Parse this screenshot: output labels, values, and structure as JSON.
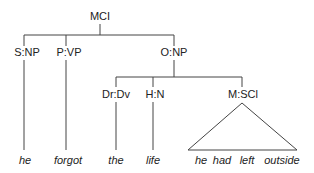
{
  "tree": {
    "root": "MCI",
    "children": [
      {
        "label": "S:NP",
        "leaf": "he"
      },
      {
        "label": "P:VP",
        "leaf": "forgot"
      },
      {
        "label": "O:NP",
        "children": [
          {
            "label": "Dr:Dv",
            "leaf": "the"
          },
          {
            "label": "H:N",
            "leaf": "life"
          },
          {
            "label": "M:SCl",
            "triangle_leaves": [
              "he",
              "had",
              "left",
              "outside"
            ]
          }
        ]
      }
    ]
  }
}
